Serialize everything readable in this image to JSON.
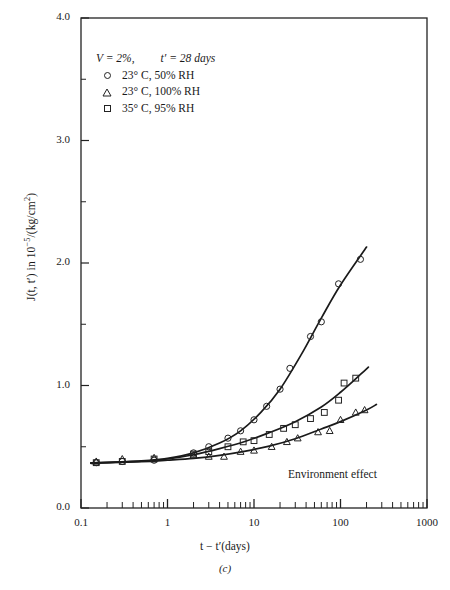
{
  "chart_data": {
    "type": "scatter",
    "title": "",
    "caption": "(c)",
    "annotation": "Environment effect",
    "xlabel": "t − t′(days)",
    "ylabel_html": "J(t, t′) in 10<sup>−5</sup>/(kg/cm<sup>2</sup>)",
    "xscale": "log",
    "yscale": "linear",
    "xlim": [
      0.1,
      1000
    ],
    "ylim": [
      0.0,
      4.0
    ],
    "xticks": [
      "0.1",
      "1",
      "10",
      "100",
      "1000"
    ],
    "xtick_values": [
      0.1,
      1,
      10,
      100,
      1000
    ],
    "yticks": [
      "0.0",
      "1.0",
      "2.0",
      "3.0",
      "4.0"
    ],
    "ytick_values": [
      0.0,
      1.0,
      2.0,
      3.0,
      4.0
    ],
    "yminor_values": [
      0.5,
      1.5,
      2.5,
      3.5
    ],
    "grid": false,
    "legend_position": "upper-left",
    "conditions": {
      "volume": "V = 2%,",
      "age": "t′ = 28 days"
    },
    "series": [
      {
        "name": "23° C,  50% RH",
        "marker": "circle",
        "points": [
          {
            "x": 0.15,
            "y": 0.37
          },
          {
            "x": 0.3,
            "y": 0.38
          },
          {
            "x": 0.7,
            "y": 0.39
          },
          {
            "x": 2.0,
            "y": 0.45
          },
          {
            "x": 3.0,
            "y": 0.5
          },
          {
            "x": 5.0,
            "y": 0.57
          },
          {
            "x": 7.0,
            "y": 0.63
          },
          {
            "x": 10.0,
            "y": 0.72
          },
          {
            "x": 14.0,
            "y": 0.83
          },
          {
            "x": 20.0,
            "y": 0.97
          },
          {
            "x": 26.0,
            "y": 1.14
          },
          {
            "x": 45.0,
            "y": 1.4
          },
          {
            "x": 60.0,
            "y": 1.52
          },
          {
            "x": 95.0,
            "y": 1.83
          },
          {
            "x": 170.0,
            "y": 2.03
          }
        ],
        "curve": [
          {
            "x": 0.13,
            "y": 0.365
          },
          {
            "x": 0.5,
            "y": 0.385
          },
          {
            "x": 1.0,
            "y": 0.405
          },
          {
            "x": 2.0,
            "y": 0.45
          },
          {
            "x": 4.0,
            "y": 0.53
          },
          {
            "x": 7.0,
            "y": 0.63
          },
          {
            "x": 12.0,
            "y": 0.78
          },
          {
            "x": 20.0,
            "y": 0.97
          },
          {
            "x": 35.0,
            "y": 1.25
          },
          {
            "x": 60.0,
            "y": 1.55
          },
          {
            "x": 100.0,
            "y": 1.82
          },
          {
            "x": 200.0,
            "y": 2.13
          }
        ]
      },
      {
        "name": "23° C, 100% RH",
        "marker": "triangle",
        "points": [
          {
            "x": 0.15,
            "y": 0.38
          },
          {
            "x": 0.3,
            "y": 0.4
          },
          {
            "x": 0.7,
            "y": 0.41
          },
          {
            "x": 2.0,
            "y": 0.43
          },
          {
            "x": 3.0,
            "y": 0.42
          },
          {
            "x": 4.5,
            "y": 0.42
          },
          {
            "x": 7.0,
            "y": 0.46
          },
          {
            "x": 10.0,
            "y": 0.47
          },
          {
            "x": 16.0,
            "y": 0.5
          },
          {
            "x": 24.0,
            "y": 0.54
          },
          {
            "x": 32.0,
            "y": 0.57
          },
          {
            "x": 55.0,
            "y": 0.62
          },
          {
            "x": 75.0,
            "y": 0.63
          },
          {
            "x": 100.0,
            "y": 0.72
          },
          {
            "x": 150.0,
            "y": 0.78
          },
          {
            "x": 190.0,
            "y": 0.8
          }
        ],
        "curve": [
          {
            "x": 0.13,
            "y": 0.368
          },
          {
            "x": 0.5,
            "y": 0.378
          },
          {
            "x": 1.0,
            "y": 0.39
          },
          {
            "x": 2.0,
            "y": 0.405
          },
          {
            "x": 4.0,
            "y": 0.43
          },
          {
            "x": 8.0,
            "y": 0.465
          },
          {
            "x": 15.0,
            "y": 0.505
          },
          {
            "x": 30.0,
            "y": 0.565
          },
          {
            "x": 60.0,
            "y": 0.645
          },
          {
            "x": 100.0,
            "y": 0.705
          },
          {
            "x": 200.0,
            "y": 0.8
          },
          {
            "x": 260.0,
            "y": 0.845
          }
        ]
      },
      {
        "name": "35° C,  95% RH",
        "marker": "square",
        "points": [
          {
            "x": 0.15,
            "y": 0.37
          },
          {
            "x": 0.3,
            "y": 0.38
          },
          {
            "x": 0.7,
            "y": 0.4
          },
          {
            "x": 2.0,
            "y": 0.44
          },
          {
            "x": 3.0,
            "y": 0.46
          },
          {
            "x": 5.0,
            "y": 0.5
          },
          {
            "x": 7.5,
            "y": 0.54
          },
          {
            "x": 10.0,
            "y": 0.55
          },
          {
            "x": 15.0,
            "y": 0.6
          },
          {
            "x": 22.0,
            "y": 0.65
          },
          {
            "x": 30.0,
            "y": 0.68
          },
          {
            "x": 45.0,
            "y": 0.73
          },
          {
            "x": 65.0,
            "y": 0.78
          },
          {
            "x": 95.0,
            "y": 0.88
          },
          {
            "x": 110.0,
            "y": 1.02
          },
          {
            "x": 150.0,
            "y": 1.06
          }
        ],
        "curve": [
          {
            "x": 0.13,
            "y": 0.367
          },
          {
            "x": 0.5,
            "y": 0.383
          },
          {
            "x": 1.0,
            "y": 0.4
          },
          {
            "x": 2.0,
            "y": 0.435
          },
          {
            "x": 4.0,
            "y": 0.485
          },
          {
            "x": 8.0,
            "y": 0.545
          },
          {
            "x": 15.0,
            "y": 0.615
          },
          {
            "x": 30.0,
            "y": 0.705
          },
          {
            "x": 60.0,
            "y": 0.825
          },
          {
            "x": 100.0,
            "y": 0.945
          },
          {
            "x": 170.0,
            "y": 1.09
          },
          {
            "x": 210.0,
            "y": 1.15
          }
        ]
      }
    ]
  }
}
